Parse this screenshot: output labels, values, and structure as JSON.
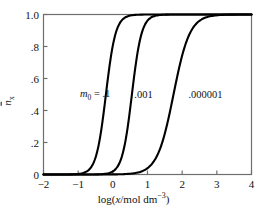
{
  "chart_data": {
    "type": "line",
    "title": "",
    "xlabel": "log(x/mol dm−3)",
    "ylabel": "n̄x",
    "xlim": [
      -2,
      4
    ],
    "ylim": [
      0,
      1.0
    ],
    "grid": false,
    "legend_position": "inline-annotation",
    "xticks": [
      -2,
      -1,
      0,
      1,
      2,
      3,
      4
    ],
    "xtick_labels": [
      "−2",
      "−1",
      "0",
      "1",
      "2",
      "3",
      "4"
    ],
    "yticks": [
      0,
      0.2,
      0.4,
      0.6,
      0.8,
      1.0
    ],
    "ytick_labels": [
      "0",
      ".2",
      ".4",
      ".6",
      ".8",
      "1.0"
    ],
    "annotations": [
      {
        "text_prefix": "m",
        "text_sub": "0",
        "text_suffix": " = .1",
        "value": ".1",
        "x": -0.95,
        "y": 0.5
      },
      {
        "text_prefix": "",
        "text_sub": "",
        "text_suffix": ".001",
        "value": ".001",
        "x": 0.62,
        "y": 0.5
      },
      {
        "text_prefix": "",
        "text_sub": "",
        "text_suffix": ".000001",
        "value": ".000001",
        "x": 2.18,
        "y": 0.5
      }
    ],
    "series": [
      {
        "name": "m0 = .1",
        "midpoint": -0.2,
        "slope": 3.1,
        "x": [
          -2.0,
          -1.75,
          -1.5,
          -1.25,
          -1.0,
          -0.9,
          -0.8,
          -0.7,
          -0.6,
          -0.5,
          -0.4,
          -0.3,
          -0.2,
          -0.1,
          0.0,
          0.1,
          0.2,
          0.3,
          0.4,
          0.5,
          0.6,
          0.8,
          1.0,
          1.25,
          1.5,
          2.0,
          2.5,
          3.0,
          3.5,
          4.0
        ],
        "y": [
          0.003,
          0.005,
          0.01,
          0.02,
          0.041,
          0.054,
          0.071,
          0.093,
          0.12,
          0.154,
          0.196,
          0.246,
          0.304,
          0.369,
          0.439,
          0.511,
          0.582,
          0.649,
          0.71,
          0.764,
          0.81,
          0.881,
          0.928,
          0.962,
          0.981,
          0.995,
          0.999,
          1.0,
          1.0,
          1.0
        ]
      },
      {
        "name": ".001",
        "midpoint": 0.55,
        "slope": 3.1,
        "x": [
          -2.0,
          -1.5,
          -1.25,
          -1.0,
          -0.75,
          -0.5,
          -0.35,
          -0.2,
          -0.05,
          0.1,
          0.25,
          0.4,
          0.55,
          0.7,
          0.85,
          1.0,
          1.15,
          1.3,
          1.5,
          1.75,
          2.0,
          2.25,
          2.5,
          3.0,
          3.5,
          4.0
        ],
        "y": [
          0.001,
          0.002,
          0.004,
          0.007,
          0.014,
          0.028,
          0.042,
          0.062,
          0.091,
          0.131,
          0.185,
          0.253,
          0.335,
          0.427,
          0.522,
          0.615,
          0.699,
          0.771,
          0.845,
          0.908,
          0.946,
          0.968,
          0.981,
          0.994,
          0.998,
          1.0
        ]
      },
      {
        "name": ".000001",
        "midpoint": 1.75,
        "slope": 1.85,
        "x": [
          -2.0,
          -1.5,
          -1.0,
          -0.5,
          -0.25,
          0.0,
          0.2,
          0.4,
          0.6,
          0.8,
          1.0,
          1.2,
          1.4,
          1.6,
          1.8,
          2.0,
          2.2,
          2.4,
          2.6,
          2.8,
          3.0,
          3.25,
          3.5,
          3.75,
          4.0
        ],
        "y": [
          0.001,
          0.002,
          0.003,
          0.006,
          0.009,
          0.013,
          0.018,
          0.026,
          0.038,
          0.055,
          0.081,
          0.12,
          0.176,
          0.255,
          0.356,
          0.47,
          0.583,
          0.684,
          0.767,
          0.832,
          0.88,
          0.924,
          0.952,
          0.97,
          0.981
        ]
      }
    ]
  },
  "axes": {
    "y_title_main": "n",
    "y_title_sub": "x",
    "x_title_main": "log(",
    "x_title_var": "x",
    "x_title_units": "/mol dm",
    "x_title_exp": "−3",
    "x_title_close": ")"
  },
  "colors": {
    "curve": "#000000",
    "frame": "#6e6e6e",
    "text": "#111111",
    "background": "#ffffff"
  }
}
